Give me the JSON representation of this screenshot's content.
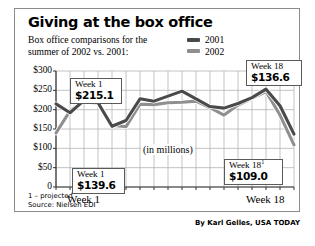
{
  "header": {
    "title": "Giving at the box office",
    "subtitle_line1": "Box office comparisons for the",
    "subtitle_line2": "summer of 2002 vs. 2001:"
  },
  "legend": {
    "items": [
      {
        "label": "2001",
        "color": "#4a4a4a"
      },
      {
        "label": "2002",
        "color": "#8f8f8f"
      }
    ]
  },
  "annotations": {
    "units_note": "(in millions)",
    "callout_top_left": {
      "week": "Week 1",
      "value": "$215.1",
      "sup": ""
    },
    "callout_top_right": {
      "week": "Week 18",
      "value": "$136.6",
      "sup": ""
    },
    "callout_bottom_left": {
      "week": "Week 1",
      "value": "$139.6",
      "sup": ""
    },
    "callout_bottom_right": {
      "week": "Week 18",
      "value": "$109.0",
      "sup": "1"
    }
  },
  "axis": {
    "x_label_left": "Week 1",
    "x_label_right": "Week 18",
    "y_ticks": [
      "$300",
      "$250",
      "$200",
      "$150",
      "$100",
      "$50",
      "0"
    ]
  },
  "footnotes": {
    "projected": "1 – projected",
    "source": "Source: Nielsen EDI"
  },
  "credit": "By Karl Gelles, USA TODAY",
  "chart_data": {
    "type": "line",
    "title": "Giving at the box office",
    "subtitle": "Box office comparisons for the summer of 2002 vs. 2001:",
    "xlabel": "Week",
    "ylabel": "(in millions)",
    "ylim": [
      0,
      300
    ],
    "yticks": [
      0,
      50,
      100,
      150,
      200,
      250,
      300
    ],
    "ytick_labels": [
      "0",
      "$50",
      "$100",
      "$150",
      "$200",
      "$250",
      "$300"
    ],
    "x": [
      1,
      2,
      3,
      4,
      5,
      6,
      7,
      8,
      9,
      10,
      11,
      12,
      13,
      14,
      15,
      16,
      17,
      18
    ],
    "xtick_labels": [
      "Week 1",
      "",
      "",
      "",
      "",
      "",
      "",
      "",
      "",
      "",
      "",
      "",
      "",
      "",
      "",
      "",
      "",
      "Week 18"
    ],
    "grid": true,
    "legend_position": "top-right",
    "series": [
      {
        "name": "2001",
        "color": "#4a4a4a",
        "values": [
          215.1,
          192.0,
          224.0,
          218.0,
          157.0,
          172.0,
          228.0,
          222.0,
          235.0,
          248.0,
          228.0,
          208.0,
          204.0,
          216.0,
          231.0,
          253.0,
          210.0,
          136.6
        ]
      },
      {
        "name": "2002",
        "color": "#8f8f8f",
        "values": [
          139.6,
          197.0,
          222.0,
          216.0,
          160.0,
          156.0,
          214.0,
          213.0,
          218.0,
          219.0,
          222.0,
          205.0,
          186.0,
          212.0,
          229.0,
          247.0,
          186.0,
          109.0
        ]
      }
    ],
    "annotations": [
      {
        "label": "Week 1",
        "value": 215.1,
        "series": "2001",
        "x": 1
      },
      {
        "label": "Week 18",
        "value": 136.6,
        "series": "2001",
        "x": 18
      },
      {
        "label": "Week 1",
        "value": 139.6,
        "series": "2002",
        "x": 1
      },
      {
        "label": "Week 18",
        "value": 109.0,
        "series": "2002",
        "x": 18,
        "footnote": "projected"
      }
    ]
  }
}
